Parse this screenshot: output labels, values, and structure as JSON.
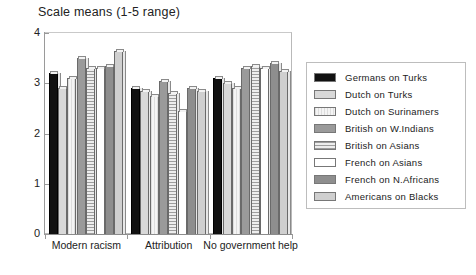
{
  "chart_data": {
    "type": "bar",
    "title": "Scale means (1-5 range)",
    "xlabel": "",
    "ylabel": "",
    "ylim": [
      0,
      4
    ],
    "yticks": [
      0,
      1,
      2,
      3,
      4
    ],
    "grid": false,
    "legend_position": "right",
    "categories": [
      "Modern racism",
      "Attribution",
      "No government help"
    ],
    "series": [
      {
        "name": "Germans on Turks",
        "fill": "f-black",
        "values": [
          3.2,
          2.9,
          3.1
        ]
      },
      {
        "name": "Dutch on Turks",
        "fill": "f-dot-lt",
        "values": [
          2.9,
          2.85,
          3.0
        ]
      },
      {
        "name": "Dutch on Surinamers",
        "fill": "f-vlight",
        "values": [
          3.1,
          2.75,
          2.9
        ]
      },
      {
        "name": "British on W.Indians",
        "fill": "f-gray",
        "values": [
          3.5,
          3.05,
          3.3
        ]
      },
      {
        "name": "British on Asians",
        "fill": "f-hline",
        "values": [
          3.3,
          2.8,
          3.35
        ]
      },
      {
        "name": "French on Asians",
        "fill": "f-white",
        "values": [
          3.3,
          2.45,
          3.3
        ]
      },
      {
        "name": "French on N.Africans",
        "fill": "f-dgray",
        "values": [
          3.35,
          2.9,
          3.4
        ]
      },
      {
        "name": "Americans on Blacks",
        "fill": "f-dot-md",
        "values": [
          3.65,
          2.85,
          3.25
        ]
      }
    ]
  }
}
